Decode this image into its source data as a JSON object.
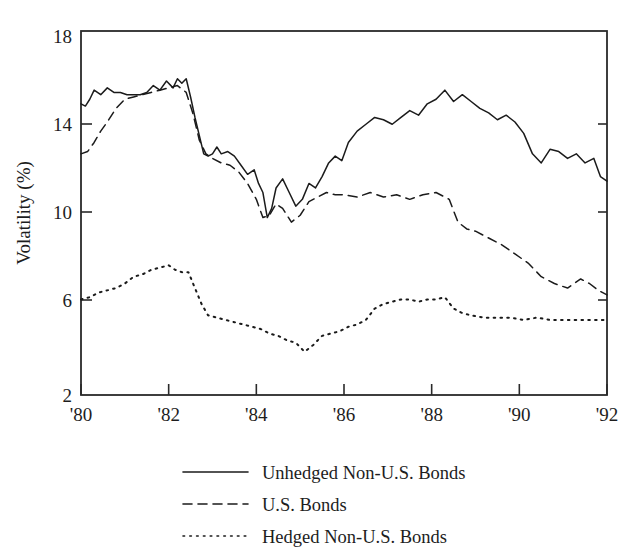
{
  "chart_data": {
    "type": "line",
    "title": "",
    "subtitle": "",
    "xlabel": "",
    "ylabel": "Volatility (%)",
    "xlim": [
      1980,
      1992
    ],
    "ylim": [
      2,
      18
    ],
    "grid": false,
    "legend_position": "below",
    "x_tick_labels": [
      "'80",
      "'82",
      "'84",
      "'86",
      "'88",
      "'90",
      "'92"
    ],
    "x_tick_values": [
      1980,
      1982,
      1984,
      1986,
      1988,
      1990,
      1992
    ],
    "y_tick_labels": [
      "18",
      "14",
      "10",
      "6",
      "2"
    ],
    "y_tick_values": [
      18,
      14,
      10,
      6,
      2
    ],
    "series": [
      {
        "name": "Unhedged Non-U.S. Bonds",
        "style": "solid",
        "x": [
          1980.0,
          1980.1,
          1980.2,
          1980.3,
          1980.45,
          1980.6,
          1980.75,
          1980.9,
          1981.05,
          1981.2,
          1981.35,
          1981.5,
          1981.65,
          1981.8,
          1981.95,
          1982.1,
          1982.2,
          1982.3,
          1982.4,
          1982.5,
          1982.6,
          1982.7,
          1982.8,
          1982.9,
          1983.0,
          1983.1,
          1983.2,
          1983.35,
          1983.5,
          1983.65,
          1983.8,
          1983.95,
          1984.05,
          1984.15,
          1984.25,
          1984.35,
          1984.45,
          1984.6,
          1984.75,
          1984.9,
          1985.05,
          1985.2,
          1985.35,
          1985.5,
          1985.65,
          1985.8,
          1985.95,
          1986.1,
          1986.3,
          1986.5,
          1986.7,
          1986.9,
          1987.1,
          1987.3,
          1987.5,
          1987.7,
          1987.9,
          1988.1,
          1988.3,
          1988.5,
          1988.7,
          1988.9,
          1989.1,
          1989.3,
          1989.5,
          1989.7,
          1989.9,
          1990.1,
          1990.3,
          1990.5,
          1990.7,
          1990.9,
          1991.1,
          1991.3,
          1991.5,
          1991.7,
          1991.85,
          1992.0
        ],
        "y": [
          14.8,
          14.7,
          15.0,
          15.4,
          15.2,
          15.5,
          15.3,
          15.3,
          15.2,
          15.2,
          15.2,
          15.3,
          15.6,
          15.4,
          15.8,
          15.5,
          15.9,
          15.7,
          15.9,
          15.1,
          14.2,
          13.4,
          12.6,
          12.5,
          12.6,
          12.9,
          12.6,
          12.7,
          12.5,
          12.1,
          11.7,
          11.9,
          11.3,
          10.9,
          9.8,
          10.2,
          11.1,
          11.5,
          10.9,
          10.3,
          10.6,
          11.3,
          11.1,
          11.6,
          12.2,
          12.5,
          12.3,
          13.1,
          13.6,
          13.9,
          14.2,
          14.1,
          13.9,
          14.2,
          14.5,
          14.3,
          14.8,
          15.0,
          15.4,
          14.9,
          15.2,
          14.9,
          14.6,
          14.4,
          14.1,
          14.3,
          14.0,
          13.5,
          12.6,
          12.2,
          12.8,
          12.7,
          12.4,
          12.6,
          12.2,
          12.4,
          11.6,
          11.4
        ]
      },
      {
        "name": "U.S. Bonds",
        "style": "dashed",
        "x": [
          1980.0,
          1980.15,
          1980.3,
          1980.45,
          1980.6,
          1980.8,
          1981.0,
          1981.2,
          1981.4,
          1981.6,
          1981.8,
          1982.0,
          1982.2,
          1982.4,
          1982.55,
          1982.7,
          1982.85,
          1983.0,
          1983.2,
          1983.4,
          1983.6,
          1983.8,
          1984.0,
          1984.15,
          1984.3,
          1984.45,
          1984.6,
          1984.8,
          1985.0,
          1985.2,
          1985.4,
          1985.6,
          1985.8,
          1986.0,
          1986.3,
          1986.6,
          1986.9,
          1987.2,
          1987.5,
          1987.8,
          1988.1,
          1988.4,
          1988.6,
          1988.8,
          1989.0,
          1989.3,
          1989.6,
          1989.9,
          1990.2,
          1990.5,
          1990.8,
          1991.1,
          1991.4,
          1991.6,
          1991.8,
          1992.0
        ],
        "y": [
          12.6,
          12.7,
          13.1,
          13.6,
          14.0,
          14.6,
          15.0,
          15.1,
          15.2,
          15.3,
          15.4,
          15.5,
          15.6,
          15.3,
          14.4,
          13.2,
          12.6,
          12.4,
          12.2,
          12.1,
          11.8,
          11.3,
          10.6,
          9.8,
          9.9,
          10.4,
          10.2,
          9.6,
          9.9,
          10.5,
          10.7,
          10.9,
          10.8,
          10.8,
          10.7,
          10.9,
          10.7,
          10.8,
          10.6,
          10.8,
          10.9,
          10.6,
          9.6,
          9.3,
          9.2,
          8.9,
          8.6,
          8.2,
          7.8,
          7.2,
          6.9,
          6.7,
          7.1,
          6.9,
          6.6,
          6.4
        ]
      },
      {
        "name": "Hedged Non-U.S. Bonds",
        "style": "dotted",
        "x": [
          1980.0,
          1980.2,
          1980.4,
          1980.6,
          1980.8,
          1981.0,
          1981.2,
          1981.4,
          1981.6,
          1981.8,
          1982.0,
          1982.15,
          1982.3,
          1982.45,
          1982.6,
          1982.75,
          1982.9,
          1983.1,
          1983.3,
          1983.5,
          1983.7,
          1983.9,
          1984.1,
          1984.3,
          1984.5,
          1984.7,
          1984.9,
          1985.1,
          1985.3,
          1985.5,
          1985.7,
          1985.9,
          1986.1,
          1986.3,
          1986.5,
          1986.7,
          1986.9,
          1987.1,
          1987.3,
          1987.5,
          1987.7,
          1987.9,
          1988.1,
          1988.3,
          1988.5,
          1988.7,
          1988.9,
          1989.2,
          1989.5,
          1989.8,
          1990.1,
          1990.4,
          1990.7,
          1991.0,
          1991.3,
          1991.6,
          1992.0
        ],
        "y": [
          6.2,
          6.3,
          6.5,
          6.6,
          6.7,
          6.9,
          7.2,
          7.3,
          7.5,
          7.6,
          7.7,
          7.5,
          7.4,
          7.4,
          6.7,
          6.0,
          5.5,
          5.4,
          5.3,
          5.2,
          5.1,
          5.0,
          4.9,
          4.7,
          4.6,
          4.4,
          4.3,
          3.9,
          4.2,
          4.6,
          4.7,
          4.8,
          5.0,
          5.1,
          5.3,
          5.8,
          6.0,
          6.1,
          6.2,
          6.2,
          6.1,
          6.2,
          6.2,
          6.3,
          5.8,
          5.6,
          5.5,
          5.4,
          5.4,
          5.4,
          5.3,
          5.4,
          5.3,
          5.3,
          5.3,
          5.3,
          5.3
        ]
      }
    ],
    "legend_entries": [
      {
        "label": "Unhedged Non-U.S. Bonds",
        "style": "solid"
      },
      {
        "label": "U.S. Bonds",
        "style": "dashed"
      },
      {
        "label": "Hedged Non-U.S. Bonds",
        "style": "dotted"
      }
    ],
    "colors": {
      "line": "#1b1b1b",
      "axis": "#2a2a2a",
      "background": "#ffffff"
    }
  }
}
